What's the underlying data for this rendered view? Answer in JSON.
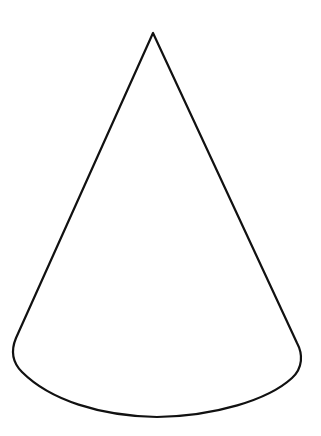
{
  "figure": {
    "background": "#ffffff",
    "stroke_color": "#111111",
    "stroke_width": 2.2
  }
}
